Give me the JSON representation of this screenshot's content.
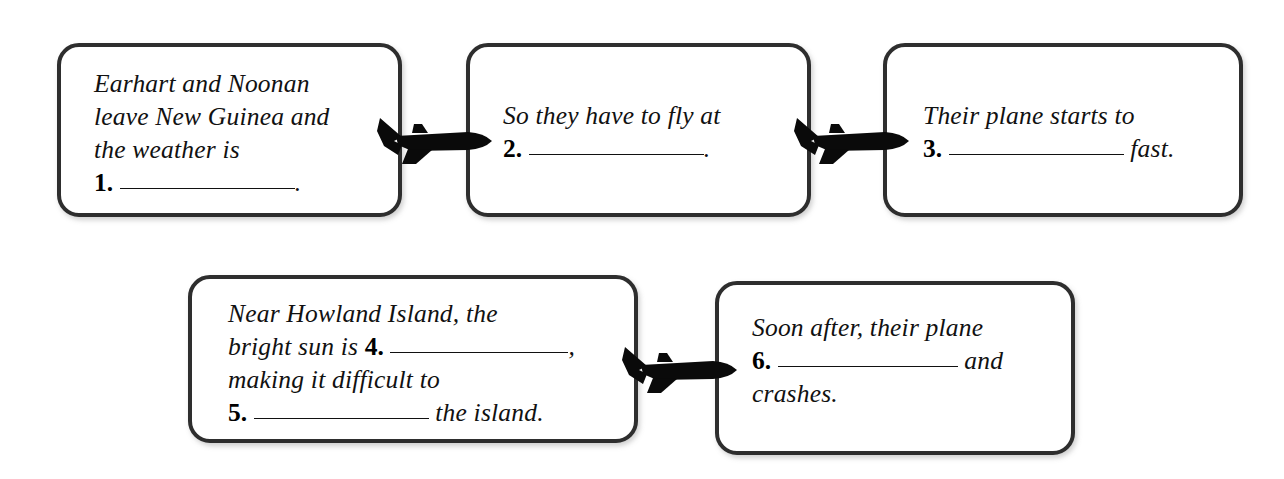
{
  "worksheet": {
    "type": "sequence-flowchart",
    "background_color": "#ffffff",
    "box_border_color": "#2e2e2e",
    "text_color": "#111111",
    "connector_icon": "airplane-icon",
    "connector_color": "#000000",
    "boxes": [
      {
        "id": "box1",
        "position": "top-left",
        "lines": [
          {
            "type": "text",
            "text": "Earhart and Noonan"
          },
          {
            "type": "text",
            "text": "leave New Guinea and"
          },
          {
            "type": "text",
            "text": "the weather is"
          },
          {
            "type": "blank",
            "number": "1.",
            "blank_width": 175,
            "after": "."
          }
        ]
      },
      {
        "id": "box2",
        "position": "top-center",
        "lines": [
          {
            "type": "text",
            "text": "So they have to fly at"
          },
          {
            "type": "blank",
            "number": "2.",
            "blank_width": 175,
            "after": "."
          }
        ]
      },
      {
        "id": "box3",
        "position": "top-right",
        "lines": [
          {
            "type": "text",
            "text": "Their plane starts to"
          },
          {
            "type": "blank",
            "number": "3.",
            "blank_width": 175,
            "after": " fast."
          }
        ]
      },
      {
        "id": "box45",
        "position": "bottom-left",
        "lines": [
          {
            "type": "text",
            "text": "Near Howland Island, the"
          },
          {
            "type": "blank",
            "before": "bright sun is ",
            "number": "4.",
            "blank_width": 178,
            "after": ","
          },
          {
            "type": "text",
            "text": "making it difficult to"
          },
          {
            "type": "blank",
            "number": "5.",
            "blank_width": 175,
            "after": " the island."
          }
        ]
      },
      {
        "id": "box6",
        "position": "bottom-right",
        "lines": [
          {
            "type": "text",
            "text": "Soon after, their plane"
          },
          {
            "type": "blank",
            "number": "6.",
            "blank_width": 180,
            "after": " and"
          },
          {
            "type": "text",
            "text": "crashes."
          }
        ]
      }
    ],
    "connectors": [
      {
        "id": "plane1",
        "icon": "airplane-icon",
        "from": "box1",
        "to": "box2",
        "direction": "right"
      },
      {
        "id": "plane2",
        "icon": "airplane-icon",
        "from": "box2",
        "to": "box3",
        "direction": "right"
      },
      {
        "id": "plane3",
        "icon": "airplane-icon",
        "from": "box45",
        "to": "box6",
        "direction": "right"
      }
    ]
  }
}
